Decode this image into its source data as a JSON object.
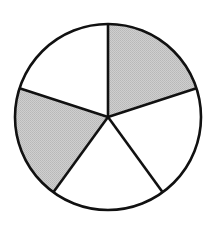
{
  "chart_data": {
    "type": "pie",
    "title": "",
    "categories": [
      "Slice 1",
      "Slice 2",
      "Slice 3",
      "Slice 4",
      "Slice 5"
    ],
    "values": [
      1,
      1,
      1,
      1,
      1
    ],
    "shaded": [
      true,
      false,
      false,
      true,
      false
    ],
    "start_angle_deg": -90,
    "direction": "clockwise",
    "colors": {
      "shaded": "#c6c6c6",
      "unshaded": "#ffffff",
      "stroke": "#111111"
    },
    "legend": null,
    "center": [
      108,
      117
    ],
    "radius": 93
  }
}
